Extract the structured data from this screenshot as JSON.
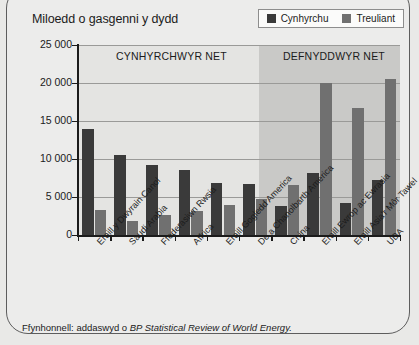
{
  "chart_title": "Miloedd o gasgenni y dydd",
  "legend": {
    "items": [
      {
        "label": "Cynhyrchu",
        "color": "#3a3a3a",
        "name": "production"
      },
      {
        "label": "Treuliant",
        "color": "#707070",
        "name": "consumption"
      }
    ]
  },
  "zones": {
    "producers": "CYNHYRCHWYR NET",
    "consumers": "DEFNYDDWYR NET"
  },
  "source": {
    "prefix": "Ffynhonnell: addaswyd o",
    "italic": "BP Statistical Review of World Energy."
  },
  "colors": {
    "production_bar": "#3a3a3a",
    "consumption_bar": "#707070",
    "plot_background": "#e4e4e2",
    "consumers_band": "#c9c9c7",
    "gridline": "#9a9a98",
    "axis": "#1b1b1b",
    "card_border": "#5d5d5d"
  },
  "chart_data": {
    "type": "bar",
    "title": "Miloedd o gasgenni y dydd",
    "xlabel": "",
    "ylabel": "Miloedd o gasgenni y dydd",
    "ylim": [
      0,
      25000
    ],
    "yticks": [
      0,
      5000,
      10000,
      15000,
      20000,
      25000
    ],
    "ytick_labels": [
      "0",
      "5 000",
      "10 000",
      "15 000",
      "20 000",
      "25 000"
    ],
    "grid": true,
    "legend_position": "top-right",
    "categories": [
      "Eraill y Dwyrain Canol",
      "Saudi Arabia",
      "Ffederasiwn Rwsia",
      "Affrica",
      "Eraill Gogledd America",
      "De a Chanolbarth America",
      "China",
      "Eraill Ewrop ac Ewrasia",
      "Eraill Asia'r Môr Tawel",
      "UDA"
    ],
    "series": [
      {
        "name": "Cynhyrchu",
        "values": [
          14000,
          10500,
          9200,
          8600,
          6900,
          6700,
          3800,
          8200,
          4200,
          7200
        ]
      },
      {
        "name": "Treuliant",
        "values": [
          3300,
          1800,
          2600,
          3100,
          4000,
          4700,
          6600,
          20000,
          16700,
          20500
        ]
      }
    ],
    "zone_split_after_category_index": 5,
    "annotations": [
      "CYNHYRCHWYR NET",
      "DEFNYDDWYR NET"
    ]
  }
}
